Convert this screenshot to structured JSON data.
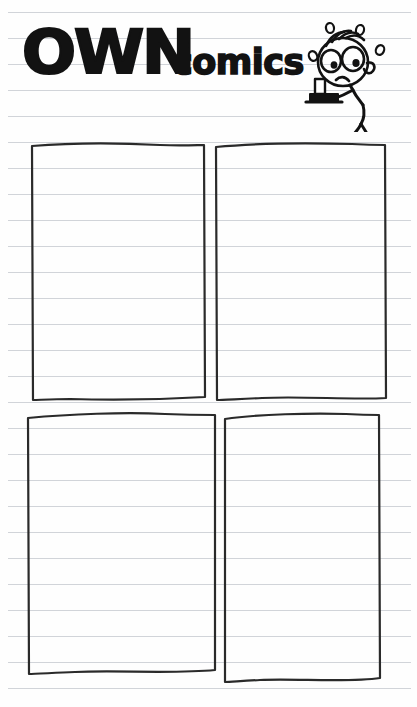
{
  "page": {
    "kind": "comic-worksheet",
    "width": 417,
    "height": 707,
    "paper_color": "#fefefe",
    "rule_color": "#c9cdd2",
    "ink_color": "#121212"
  },
  "masthead": {
    "title_bold": "OWN",
    "title_script": "comics",
    "character": {
      "name": "worried-stick-boy",
      "description": "stick figure with hair strands, large eyes, frowning mouth, sweat drops, carrying a tray with a cup",
      "sweat_drop_count": 4,
      "holds": "tray-with-cup",
      "stands_on": "ground-line"
    }
  },
  "ruled_lines": {
    "first_y": 12,
    "spacing": 26,
    "count": 27
  },
  "panels": [
    {
      "id": "panel-1",
      "position": "top-left",
      "x": 30,
      "y": 142,
      "width": 174,
      "height": 262,
      "label": "Panel 1",
      "content": ""
    },
    {
      "id": "panel-2",
      "position": "top-right",
      "x": 214,
      "y": 142,
      "width": 172,
      "height": 262,
      "label": "Panel 2",
      "content": ""
    },
    {
      "id": "panel-3",
      "position": "bottom-left",
      "x": 27,
      "y": 414,
      "width": 186,
      "height": 260,
      "label": "Panel 3",
      "content": ""
    },
    {
      "id": "panel-4",
      "position": "bottom-right",
      "x": 224,
      "y": 414,
      "width": 152,
      "height": 266,
      "label": "Panel 4",
      "content": ""
    }
  ]
}
